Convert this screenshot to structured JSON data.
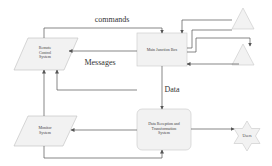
{
  "diagram": {
    "type": "flowchart",
    "nodes": {
      "remote_control": {
        "label_lines": [
          "Remote",
          "Control",
          "System"
        ],
        "shape": "parallelogram"
      },
      "main_junction": {
        "label": "Main Junction Box",
        "shape": "rectangle"
      },
      "sensor_top": {
        "label": "",
        "shape": "triangle"
      },
      "sensor_bottom": {
        "label": "",
        "shape": "triangle"
      },
      "data_reception": {
        "label_lines": [
          "Data Reception and",
          "Transformation",
          "System"
        ],
        "shape": "rounded-rectangle"
      },
      "monitor": {
        "label_lines": [
          "Monitor",
          "System"
        ],
        "shape": "parallelogram"
      },
      "users": {
        "label": "Users",
        "shape": "star"
      }
    },
    "edges": [
      {
        "from": "remote_control",
        "to": "main_junction",
        "label": "commands"
      },
      {
        "from": "main_junction",
        "to": "remote_control",
        "label": "Messages"
      },
      {
        "from": "main_junction",
        "to": "data_reception",
        "label": "Data"
      },
      {
        "from": "data_reception",
        "to": "users",
        "label": ""
      },
      {
        "from": "data_reception",
        "to": "monitor",
        "label": ""
      },
      {
        "from": "monitor",
        "to": "data_reception",
        "label": ""
      },
      {
        "from": "remote_control",
        "to": "data_reception",
        "label": ""
      },
      {
        "from": "main_junction",
        "to": "sensor_top",
        "label": ""
      },
      {
        "from": "sensor_top",
        "to": "main_junction",
        "label": ""
      },
      {
        "from": "main_junction",
        "to": "sensor_bottom",
        "label": ""
      },
      {
        "from": "sensor_bottom",
        "to": "main_junction",
        "label": ""
      }
    ],
    "colors": {
      "line": "#555555",
      "fill": "#f2f2f2",
      "stroke": "#bdbdbd"
    }
  }
}
